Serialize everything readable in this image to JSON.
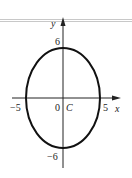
{
  "diagram": {
    "type": "ellipse-graph",
    "axes": {
      "x_label": "x",
      "y_label": "y"
    },
    "center_label": "C",
    "origin_label": "0",
    "ticks": {
      "x_neg": "−5",
      "x_pos": "5",
      "y_pos": "6",
      "y_neg": "−6"
    },
    "ellipse": {
      "center": [
        0,
        0
      ],
      "semi_axis_x": 5,
      "semi_axis_y": 6
    }
  }
}
